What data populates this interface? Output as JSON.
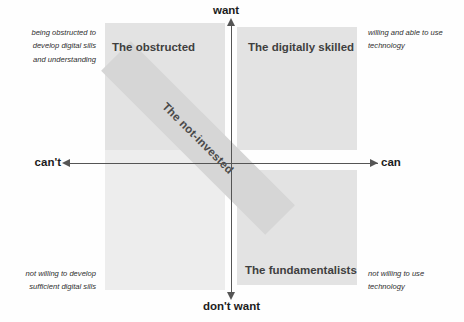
{
  "chart_data": {
    "type": "scatter",
    "title": "",
    "xlabel": "",
    "ylabel": "",
    "grid": false,
    "legend": "none",
    "axes": {
      "vertical": {
        "name": "want-axis",
        "positive_label": "want",
        "negative_label": "don't want",
        "arrow_top": "arrow-up",
        "arrow_bottom": "arrow-down"
      },
      "horizontal": {
        "name": "ability-axis",
        "negative_label": "can't",
        "positive_label": "can",
        "arrow_left": "arrow-left",
        "arrow_right": "arrow-right"
      }
    },
    "quadrants": [
      {
        "id": "top-left",
        "title": "The obstructed",
        "x": "can't",
        "y": "want",
        "annotation": "being obstructed to\ndevelop digital sills\nand understanding",
        "fill": "#e3e3e3"
      },
      {
        "id": "top-right",
        "title": "The digitally skilled",
        "x": "can",
        "y": "want",
        "annotation": "willing and able to use\ntechnology",
        "fill": "#e3e3e3"
      },
      {
        "id": "bottom-left",
        "title": "",
        "x": "can't",
        "y": "don't want",
        "annotation": "not willing to develop\nsufficient digital sills",
        "fill": "#ededed"
      },
      {
        "id": "bottom-right",
        "title": "The fundamentalists",
        "x": "can",
        "y": "don't want",
        "annotation": "not willing to use\ntechnology",
        "fill": "#e3e3e3"
      }
    ],
    "overlay_band": {
      "label": "The not-invested",
      "orientation": "diagonal",
      "angle_deg": 45,
      "from": "can/want",
      "to": "can't/don't want",
      "fill": "#d6d6d6"
    },
    "colors": {
      "quadrant_fill": "#e3e3e3",
      "quadrant_fill_light": "#ededed",
      "band_fill": "#d6d6d6",
      "axis": "#555555",
      "title_text": "#3f3f3f",
      "label_text": "#1c1c1c",
      "background": "#fefefe"
    }
  }
}
